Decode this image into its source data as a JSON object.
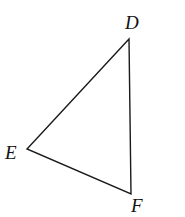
{
  "diagram": {
    "type": "triangle",
    "vertices": [
      {
        "label": "D",
        "x": 129,
        "y": 39
      },
      {
        "label": "E",
        "x": 27,
        "y": 149
      },
      {
        "label": "F",
        "x": 131,
        "y": 194
      }
    ],
    "edges": [
      [
        "D",
        "E"
      ],
      [
        "E",
        "F"
      ],
      [
        "F",
        "D"
      ]
    ],
    "colors": {
      "stroke": "#1a1a1a",
      "background": "#ffffff"
    }
  }
}
